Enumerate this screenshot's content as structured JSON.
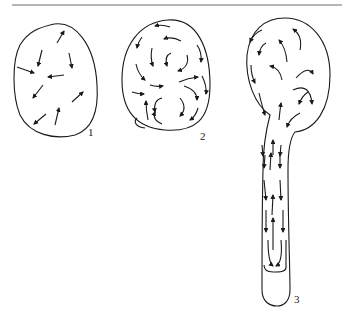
{
  "figure": {
    "panels": [
      {
        "id": "1",
        "label": "1",
        "description": "Oval cell with random short arrows"
      },
      {
        "id": "2",
        "label": "2",
        "description": "Oval cell with curved circulating arrows"
      },
      {
        "id": "3",
        "label": "3",
        "description": "Cell with long tubular extension, arrows streaming along tube"
      }
    ],
    "colors": {
      "stroke": "#1a1a1a",
      "rule": "#b5b5b5",
      "background": "#ffffff"
    },
    "caption": ""
  }
}
